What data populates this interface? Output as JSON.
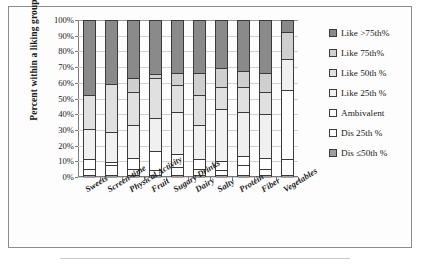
{
  "chart_data": {
    "type": "bar",
    "subtype": "stacked-percent-column",
    "title": "",
    "xlabel": "",
    "ylabel": "Percent within a liking group",
    "ylim": [
      0,
      100
    ],
    "ytick_labels": [
      "0%",
      "10%",
      "20%",
      "30%",
      "40%",
      "50%",
      "60%",
      "70%",
      "80%",
      "90%",
      "100%"
    ],
    "ytick_values": [
      0,
      10,
      20,
      30,
      40,
      50,
      60,
      70,
      80,
      90,
      100
    ],
    "grid": true,
    "legend_position": "right",
    "categories": [
      "Sweets",
      "Screen-time",
      "Physical Activity",
      "Fruit",
      "Sugary Drinks",
      "Dairy",
      "Salty",
      "Protein",
      "Fiber",
      "Vegetables"
    ],
    "series": [
      {
        "name": "Dis ≤50th %",
        "color": "#9e9e9e",
        "values": [
          2,
          2,
          2,
          2,
          2,
          2,
          2,
          2,
          2,
          2
        ]
      },
      {
        "name": "Dis 25th %",
        "color": "#ffffff",
        "values": [
          4,
          6,
          4,
          3,
          5,
          4,
          3,
          6,
          4,
          10
        ]
      },
      {
        "name": "Ambivalent",
        "color": "#ffffff",
        "values": [
          6,
          2,
          7,
          12,
          8,
          6,
          6,
          6,
          7,
          44
        ]
      },
      {
        "name": "Like 25th %",
        "color": "#f0f0f0",
        "values": [
          19,
          19,
          21,
          21,
          27,
          22,
          33,
          28,
          28,
          20
        ]
      },
      {
        "name": "Like 50th %",
        "color": "#e0e0e0",
        "values": [
          22,
          31,
          21,
          26,
          17,
          19,
          14,
          16,
          14,
          0
        ]
      },
      {
        "name": "Like 75th%",
        "color": "#cfcfcf",
        "values": [
          0,
          0,
          9,
          2,
          8,
          14,
          12,
          10,
          12,
          17
        ]
      },
      {
        "name": "Like >75th%",
        "color": "#8a8a8a",
        "values": [
          47,
          40,
          36,
          34,
          33,
          33,
          30,
          32,
          33,
          7
        ]
      }
    ],
    "legend_entries": [
      {
        "label": "Like >75th%",
        "color": "#8a8a8a"
      },
      {
        "label": "Like 75th%",
        "color": "#cfcfcf"
      },
      {
        "label": "Like 50th %",
        "color": "#e0e0e0"
      },
      {
        "label": "Like 25th %",
        "color": "#f0f0f0"
      },
      {
        "label": "Ambivalent",
        "color": "#ffffff"
      },
      {
        "label": "Dis 25th %",
        "color": "#ffffff"
      },
      {
        "label": "Dis ≤50th %",
        "color": "#9e9e9e"
      }
    ]
  }
}
